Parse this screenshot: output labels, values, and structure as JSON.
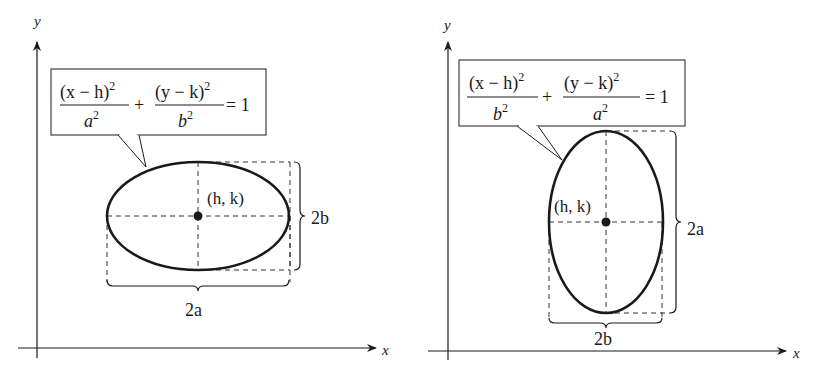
{
  "figures": [
    {
      "id": "horizontal",
      "axes": {
        "x_label": "x",
        "y_label": "y"
      },
      "equation": {
        "num1": "(x − h)",
        "num1_exp": "2",
        "den1": "a",
        "den1_exp": "2",
        "plus": "+",
        "num2": "(y − k)",
        "num2_exp": "2",
        "den2": "b",
        "den2_exp": "2",
        "equals": "= 1"
      },
      "center_label": "(h, k)",
      "major_label": "2a",
      "minor_label": "2b"
    },
    {
      "id": "vertical",
      "axes": {
        "x_label": "x",
        "y_label": "y"
      },
      "equation": {
        "num1": "(x − h)",
        "num1_exp": "2",
        "den1": "b",
        "den1_exp": "2",
        "plus": "+",
        "num2": "(y − k)",
        "num2_exp": "2",
        "den2": "a",
        "den2_exp": "2",
        "equals": "= 1"
      },
      "center_label": "(h, k)",
      "major_label": "2a",
      "minor_label": "2b"
    }
  ],
  "colors": {
    "ink": "#1a1a1a",
    "dash": "#333333",
    "background": "#ffffff"
  }
}
